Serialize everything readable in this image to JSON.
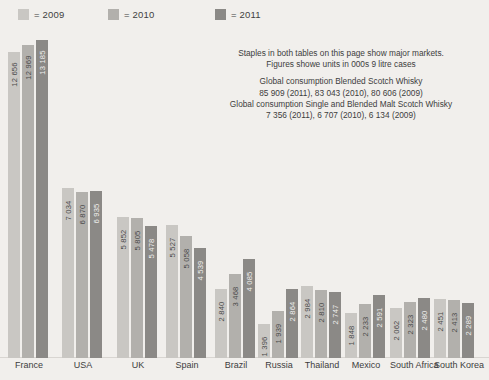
{
  "legend": {
    "items": [
      {
        "label": "= 2009",
        "color": "#c9c7c3",
        "name": "legend-2009"
      },
      {
        "label": "= 2010",
        "color": "#b2b0ac",
        "name": "legend-2010"
      },
      {
        "label": "= 2011",
        "color": "#8b8986",
        "name": "legend-2011"
      }
    ]
  },
  "note": {
    "line1": "Staples in both tables on this page show major markets.",
    "line2": "Figures showe units in 000s 9 litre cases",
    "line3": "Global consumption Blended Scotch Whisky",
    "line4": "85 909 (2011), 83 043 (2010), 80 606 (2009)",
    "line5": "Global consumption Single and Blended Malt Scotch Whisky",
    "line6": "7 356 (2011), 6 707 (2010), 6 134 (2009)"
  },
  "chart_data": {
    "type": "bar",
    "title": "",
    "xlabel": "",
    "ylabel": "",
    "ylim": [
      0,
      13500
    ],
    "grid": false,
    "legend_position": "top-left",
    "value_label_format": "space-separated thousands",
    "categories": [
      "France",
      "USA",
      "UK",
      "Spain",
      "Brazil",
      "Russia",
      "Thailand",
      "Mexico",
      "South Africa",
      "South Korea"
    ],
    "series": [
      {
        "name": "2009",
        "color": "#c9c7c3",
        "values": [
          12656,
          7034,
          5852,
          5527,
          2840,
          1396,
          2984,
          1848,
          2062,
          2451
        ],
        "labels": [
          "12 656",
          "7 034",
          "5 852",
          "5 527",
          "2 840",
          "1 396",
          "2 984",
          "1 848",
          "2 062",
          "2 451"
        ]
      },
      {
        "name": "2010",
        "color": "#b2b0ac",
        "values": [
          12969,
          6870,
          5805,
          5058,
          3468,
          1939,
          2810,
          2233,
          2323,
          2413
        ],
        "labels": [
          "12 969",
          "6 870",
          "5 805",
          "5 058",
          "3 468",
          "1 939",
          "2 810",
          "2 233",
          "2 323",
          "2 413"
        ]
      },
      {
        "name": "2011",
        "color": "#8b8986",
        "values": [
          13185,
          6935,
          5478,
          4539,
          4085,
          2864,
          2747,
          2591,
          2480,
          2289
        ],
        "labels": [
          "13 185",
          "6 935",
          "5 478",
          "4 539",
          "4 085",
          "2 864",
          "2 747",
          "2 591",
          "2 480",
          "2 289"
        ]
      }
    ]
  }
}
